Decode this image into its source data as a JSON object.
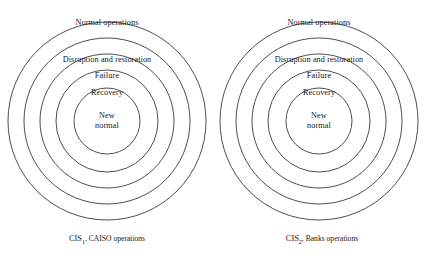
{
  "figure": {
    "type": "concentric-venn-diagram",
    "background_color": "#ffffff",
    "stroke_color": "#3b3b3b",
    "text_color": "#181818",
    "ring_labels_outer_to_inner": [
      "Normal operations",
      "Disruption and restoration",
      "Failure",
      "Recovery",
      "New normal"
    ],
    "groups": [
      {
        "id": "cis1",
        "caption_prefix": "CIS",
        "caption_subscript": "1",
        "caption_suffix": ", CAISO operations",
        "caption_full": "CIS1, CAISO operations",
        "center_x": 107,
        "center_y": 121,
        "radii_outer_to_inner": [
          99,
          83,
          67,
          51,
          33
        ],
        "rings": [
          {
            "label": "Normal operations",
            "radius": 99
          },
          {
            "label": "Disruption and restoration",
            "radius": 83
          },
          {
            "label": "Failure",
            "radius": 67
          },
          {
            "label": "Recovery",
            "radius": 51
          },
          {
            "label": "New normal",
            "radius": 33
          }
        ]
      },
      {
        "id": "cis2",
        "caption_prefix": "CIS",
        "caption_subscript": "2",
        "caption_suffix": ", Banks operations",
        "caption_full": "CIS2, Banks operations",
        "center_x": 319,
        "center_y": 121,
        "radii_outer_to_inner": [
          99,
          83,
          67,
          51,
          33
        ],
        "rings": [
          {
            "label": "Normal operations",
            "radius": 99
          },
          {
            "label": "Disruption and restoration",
            "radius": 83
          },
          {
            "label": "Failure",
            "radius": 67
          },
          {
            "label": "Recovery",
            "radius": 51
          },
          {
            "label": "New normal",
            "radius": 33
          }
        ]
      }
    ],
    "labels": {
      "left": {
        "normal": "Normal operations",
        "disruption": "Disruption and restoration",
        "failure": "Failure",
        "recovery": "Recovery",
        "newnormal_line1": "New",
        "newnormal_line2": "normal"
      },
      "right": {
        "normal": "Normal operations",
        "disruption": "Disruption and restoration",
        "failure": "Failure",
        "recovery": "Recovery",
        "newnormal_line1": "New",
        "newnormal_line2": "normal"
      }
    }
  }
}
